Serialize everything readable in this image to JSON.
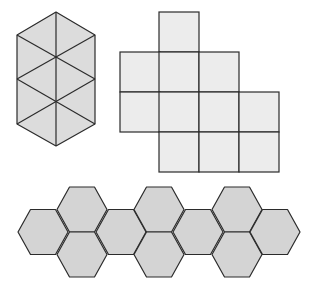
{
  "figure": {
    "colors": {
      "background": "#ffffff",
      "stroke": "#2b2b2b",
      "triangle_fill": "#dcdcdc",
      "square_fill": "#ececec",
      "hexagon_fill": "#d4d4d4"
    }
  },
  "triangles": {
    "count": 8,
    "outline": [
      [
        56,
        12
      ],
      [
        95,
        35
      ],
      [
        95,
        124
      ],
      [
        56,
        146
      ],
      [
        17,
        124
      ],
      [
        17,
        35
      ]
    ],
    "lines": [
      [
        [
          56,
          12
        ],
        [
          56,
          146
        ]
      ],
      [
        [
          17,
          35
        ],
        [
          95,
          79
        ]
      ],
      [
        [
          95,
          35
        ],
        [
          17,
          79
        ]
      ],
      [
        [
          17,
          79
        ],
        [
          95,
          124
        ]
      ],
      [
        [
          95,
          79
        ],
        [
          17,
          124
        ]
      ]
    ]
  },
  "squares": {
    "count": 11,
    "size": 40,
    "cells": [
      {
        "x": 159,
        "y": 12
      },
      {
        "x": 120,
        "y": 52
      },
      {
        "x": 159,
        "y": 52
      },
      {
        "x": 199,
        "y": 52
      },
      {
        "x": 120,
        "y": 92
      },
      {
        "x": 159,
        "y": 92
      },
      {
        "x": 199,
        "y": 92
      },
      {
        "x": 239,
        "y": 92
      },
      {
        "x": 159,
        "y": 132
      },
      {
        "x": 199,
        "y": 132
      },
      {
        "x": 239,
        "y": 132
      }
    ]
  },
  "hexagons": {
    "count": 10,
    "radius": 25,
    "half_height": 22.5,
    "centers": [
      {
        "x": 43,
        "y": 232
      },
      {
        "x": 82,
        "y": 209.5
      },
      {
        "x": 82,
        "y": 254.5
      },
      {
        "x": 121,
        "y": 232
      },
      {
        "x": 159,
        "y": 209.5
      },
      {
        "x": 159,
        "y": 254.5
      },
      {
        "x": 198,
        "y": 232
      },
      {
        "x": 237,
        "y": 209.5
      },
      {
        "x": 237,
        "y": 254.5
      },
      {
        "x": 275,
        "y": 232
      }
    ]
  }
}
